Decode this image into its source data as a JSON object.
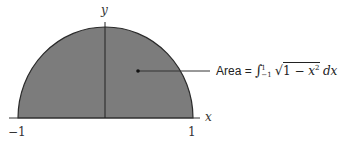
{
  "diagram": {
    "type": "semicircle-area",
    "colors": {
      "fill": "#7c7c7c",
      "stroke": "#2a2a2a",
      "axis": "#333333",
      "background": "#ffffff"
    },
    "axes": {
      "x_label": "x",
      "y_label": "y",
      "x_tick_left": "−1",
      "x_tick_right": "1"
    },
    "annotation": {
      "area_word": "Area",
      "equals": "=",
      "integral_sign": "∫",
      "upper_limit": "1",
      "lower_limit": "−1",
      "sqrt_sign": "√",
      "radicand_prefix": "1 − ",
      "radicand_var": "x",
      "radicand_exp": "2",
      "differential": "dx",
      "full_text": "Area = ∫_{-1}^{1} √(1 − x²) dx"
    }
  }
}
